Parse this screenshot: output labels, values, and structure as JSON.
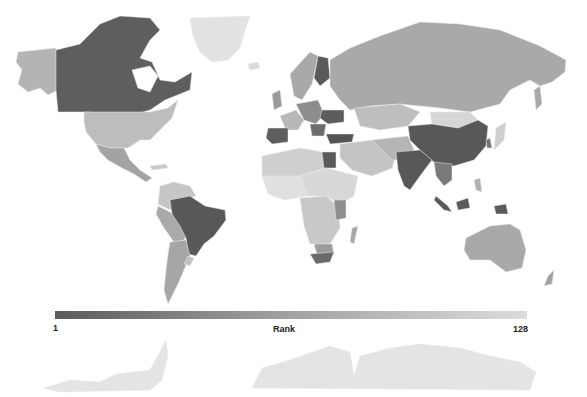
{
  "map": {
    "type": "choropleth",
    "projection": "world",
    "metric": "Rank",
    "colors": {
      "rank_1": "#5c5c5c",
      "rank_128": "#dcdcdc",
      "no_data": "#e6e6e6",
      "background": "#ffffff"
    },
    "highlighted_countries_dark": [
      "Canada",
      "Brazil",
      "China",
      "India",
      "Egypt",
      "Turkey",
      "Spain",
      "Finland",
      "Ukraine",
      "Indonesia",
      "South Africa"
    ],
    "medium_countries": [
      "United States",
      "Russia",
      "Australia",
      "Mexico",
      "Argentina",
      "Kazakhstan"
    ],
    "light_countries": [
      "Greenland",
      "Mongolia",
      "Antarctica"
    ]
  },
  "colorbar": {
    "title": "Rank",
    "min_label": "1",
    "max_label": "128",
    "min": 1,
    "max": 128,
    "orientation": "horizontal"
  }
}
